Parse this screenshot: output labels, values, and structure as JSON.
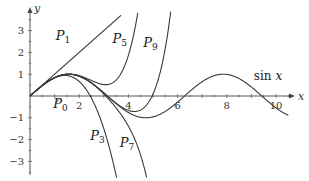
{
  "chart_data": {
    "type": "line",
    "title": "",
    "xlabel": "x",
    "ylabel": "y",
    "xlim": [
      0,
      10.7
    ],
    "ylim": [
      -3.6,
      3.9
    ],
    "grid": false,
    "x_ticks": [
      2,
      4,
      6,
      8,
      10
    ],
    "y_ticks": [
      -3,
      -2,
      -1,
      1,
      2,
      3
    ],
    "x_tick_labels": [
      "2",
      "4",
      "6",
      "8",
      "10"
    ],
    "y_tick_labels": [
      "−3",
      "−2",
      "−1",
      "1",
      "2",
      "3"
    ],
    "series": [
      {
        "name": "sin x",
        "kind": "sin",
        "x_range": [
          0,
          10.5
        ]
      },
      {
        "name": "P_0",
        "kind": "taylor",
        "order": 0,
        "x_range": [
          0,
          10.5
        ]
      },
      {
        "name": "P_1",
        "kind": "taylor",
        "order": 1,
        "x_range": [
          0,
          3.7
        ]
      },
      {
        "name": "P_3",
        "kind": "taylor",
        "order": 3,
        "x_range": [
          0,
          4.0
        ]
      },
      {
        "name": "P_5",
        "kind": "taylor",
        "order": 5,
        "x_range": [
          0,
          4.6
        ]
      },
      {
        "name": "P_7",
        "kind": "taylor",
        "order": 7,
        "x_range": [
          0,
          5.8
        ]
      },
      {
        "name": "P_9",
        "kind": "taylor",
        "order": 9,
        "x_range": [
          0,
          6.6
        ]
      }
    ],
    "annotations": [
      {
        "text": "P",
        "sub": "0",
        "x": 0.95,
        "y": -0.55
      },
      {
        "text": "P",
        "sub": "1",
        "x": 1.05,
        "y": 2.55
      },
      {
        "text": "P",
        "sub": "3",
        "x": 2.45,
        "y": -2.0
      },
      {
        "text": "P",
        "sub": "5",
        "x": 3.35,
        "y": 2.45
      },
      {
        "text": "P",
        "sub": "7",
        "x": 3.65,
        "y": -2.35
      },
      {
        "text": "P",
        "sub": "9",
        "x": 4.6,
        "y": 2.25
      },
      {
        "text": "sin x",
        "x": 9.1,
        "y": 0.75
      }
    ]
  },
  "axes": {
    "x_label": "x",
    "y_label": "y"
  },
  "style": {
    "curve_color": "#3a3a3a",
    "axis_color": "#444444"
  }
}
